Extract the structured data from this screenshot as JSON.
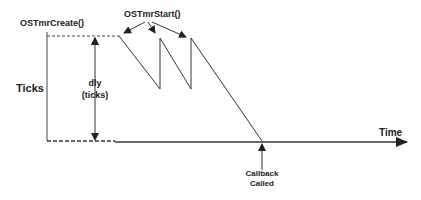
{
  "diagram": {
    "labels": {
      "create": "OSTmrCreate()",
      "start": "OSTmrStart()",
      "ticks": "Ticks",
      "dly_line1": "dly",
      "dly_line2": "(ticks)",
      "time": "Time",
      "callback_line1": "Callback",
      "callback_line2": "Called"
    },
    "colors": {
      "line": "#333333",
      "text": "#222222"
    }
  }
}
